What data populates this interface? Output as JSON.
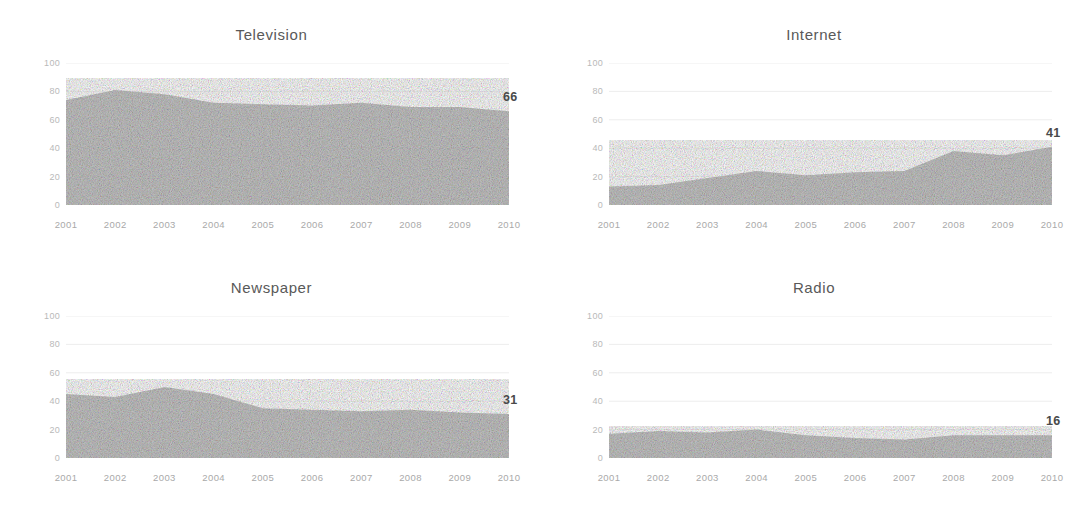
{
  "figure": {
    "background": "#ffffff",
    "area_fill": "#bfbfbf",
    "gridline_color": "#ededed",
    "title_color": "#595959",
    "tick_color": "#b4b4b4",
    "label_color": "#4a4a4a"
  },
  "panels": [
    {
      "title": "Television",
      "end_label": "66"
    },
    {
      "title": "Internet",
      "end_label": "41"
    },
    {
      "title": "Newspaper",
      "end_label": "31"
    },
    {
      "title": "Radio",
      "end_label": "16"
    }
  ],
  "axis": {
    "yticks": [
      "100",
      "80",
      "60",
      "40",
      "20",
      "0"
    ],
    "xticks": [
      "2001",
      "2002",
      "2003",
      "2004",
      "2005",
      "2006",
      "2007",
      "2008",
      "2009",
      "2010"
    ]
  },
  "chart_data": [
    {
      "type": "area",
      "title": "Television",
      "xlabel": "",
      "ylabel": "",
      "x": [
        2001,
        2002,
        2003,
        2004,
        2005,
        2006,
        2007,
        2008,
        2009,
        2010
      ],
      "values": [
        74,
        81,
        78,
        72,
        71,
        70,
        72,
        69,
        69,
        66
      ],
      "ylim": [
        0,
        100
      ],
      "xlim": [
        2001,
        2010
      ],
      "yticks": [
        0,
        20,
        40,
        60,
        80,
        100
      ],
      "grid": true,
      "legend": "none",
      "annotations": [
        {
          "text": "66",
          "x": 2010,
          "y": 66
        }
      ]
    },
    {
      "type": "area",
      "title": "Internet",
      "xlabel": "",
      "ylabel": "",
      "x": [
        2001,
        2002,
        2003,
        2004,
        2005,
        2006,
        2007,
        2008,
        2009,
        2010
      ],
      "values": [
        13,
        14,
        19,
        24,
        21,
        23,
        24,
        38,
        35,
        41
      ],
      "ylim": [
        0,
        100
      ],
      "xlim": [
        2001,
        2010
      ],
      "yticks": [
        0,
        20,
        40,
        60,
        80,
        100
      ],
      "grid": true,
      "legend": "none",
      "annotations": [
        {
          "text": "41",
          "x": 2010,
          "y": 41
        }
      ]
    },
    {
      "type": "area",
      "title": "Newspaper",
      "xlabel": "",
      "ylabel": "",
      "x": [
        2001,
        2002,
        2003,
        2004,
        2005,
        2006,
        2007,
        2008,
        2009,
        2010
      ],
      "values": [
        45,
        43,
        50,
        45,
        35,
        34,
        33,
        34,
        32,
        31
      ],
      "ylim": [
        0,
        100
      ],
      "xlim": [
        2001,
        2010
      ],
      "yticks": [
        0,
        20,
        40,
        60,
        80,
        100
      ],
      "grid": true,
      "legend": "none",
      "annotations": [
        {
          "text": "31",
          "x": 2010,
          "y": 31
        }
      ]
    },
    {
      "type": "area",
      "title": "Radio",
      "xlabel": "",
      "ylabel": "",
      "x": [
        2001,
        2002,
        2003,
        2004,
        2005,
        2006,
        2007,
        2008,
        2009,
        2010
      ],
      "values": [
        17,
        19,
        18,
        20,
        16,
        14,
        13,
        16,
        16,
        16
      ],
      "ylim": [
        0,
        100
      ],
      "xlim": [
        2001,
        2010
      ],
      "yticks": [
        0,
        20,
        40,
        60,
        80,
        100
      ],
      "grid": true,
      "legend": "none",
      "annotations": [
        {
          "text": "16",
          "x": 2010,
          "y": 16
        }
      ]
    }
  ]
}
